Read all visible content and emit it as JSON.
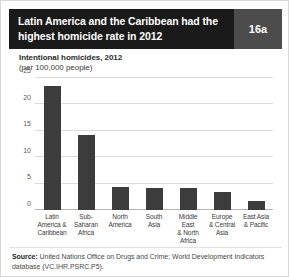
{
  "header": {
    "title": "Latin America and the Caribbean had the highest homicide rate in 2012",
    "badge": "16a",
    "title_bg": "#1a1a1a",
    "badge_bg": "#4c4c4c"
  },
  "subtitle": {
    "line1": "Intentional homicides, 2012",
    "line2": "(per 100,000 people)"
  },
  "footer": {
    "source_label": "Source:",
    "source_text": " United Nations Office on Drugs and Crime; World Development Indicators database (VC.IHR.PSRC.P5)."
  },
  "chart_data": {
    "type": "bar",
    "title": "Intentional homicides, 2012",
    "subtitle": "(per 100,000 people)",
    "xlabel": "",
    "ylabel": "",
    "ylim": [
      0,
      25
    ],
    "yticks": [
      0,
      5,
      10,
      15,
      20,
      25
    ],
    "grid": true,
    "legend": "none",
    "bar_color": "#3c3c3c",
    "categories": [
      "Latin America & Caribbean",
      "Sub-Saharan Africa",
      "North America",
      "South Asia",
      "Middle East & North Africa",
      "Europe & Central Asia",
      "East Asia & Pacific"
    ],
    "category_lines": [
      [
        "Latin",
        "America &",
        "Caribbean"
      ],
      [
        "Sub-Saharan",
        "Africa"
      ],
      [
        "North",
        "America"
      ],
      [
        "South",
        "Asia"
      ],
      [
        "Middle East",
        "& North",
        "Africa"
      ],
      [
        "Europe",
        "& Central",
        "Asia"
      ],
      [
        "East Asia",
        "& Pacific"
      ]
    ],
    "values": [
      23.5,
      14.3,
      4.4,
      4.1,
      4.1,
      3.4,
      1.7
    ]
  }
}
